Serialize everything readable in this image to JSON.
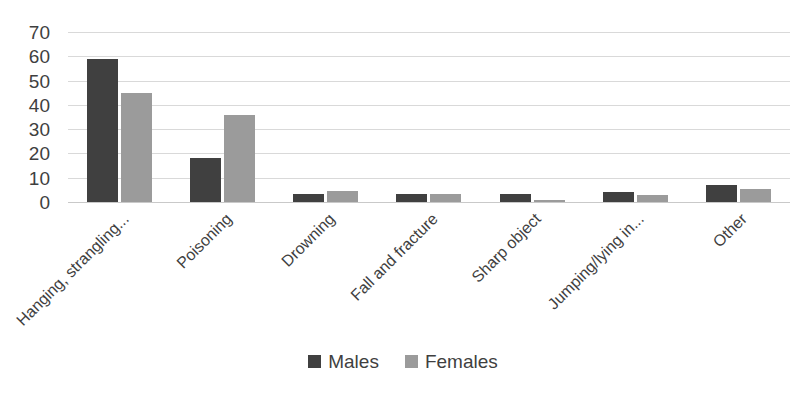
{
  "chart_data": {
    "type": "bar",
    "title": "",
    "subtitle": "",
    "xlabel": "",
    "ylabel": "",
    "ylim": [
      0,
      70
    ],
    "ytick_step": 10,
    "yticks": [
      70,
      60,
      50,
      40,
      30,
      20,
      10,
      0
    ],
    "grid": true,
    "legend_position": "bottom",
    "categories": [
      "Hanging, strangling...",
      "Poisoning",
      "Drowning",
      "Fall and fracture",
      "Sharp object",
      "Jumping/lying in...",
      "Other"
    ],
    "series": [
      {
        "name": "Males",
        "color": "#404040",
        "values": [
          59,
          18,
          3.5,
          3.5,
          3.5,
          4,
          7
        ]
      },
      {
        "name": "Females",
        "color": "#9b9b9b",
        "values": [
          45,
          36,
          4.5,
          3.5,
          1,
          3,
          5.5
        ]
      }
    ]
  },
  "legend": {
    "items": [
      {
        "label": "Males",
        "color": "#404040"
      },
      {
        "label": "Females",
        "color": "#9b9b9b"
      }
    ]
  },
  "colors": {
    "males": "#404040",
    "females": "#9b9b9b",
    "gridline": "#d9d9d9",
    "axis_text": "#3f3f3f",
    "background": "#ffffff"
  }
}
